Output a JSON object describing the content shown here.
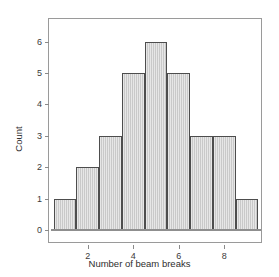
{
  "chart_data": {
    "type": "bar",
    "title": "",
    "subtitle": "",
    "xlabel": "Number of beam breaks",
    "ylabel": "Count",
    "categories": [
      1,
      2,
      3,
      4,
      5,
      6,
      7,
      8,
      9
    ],
    "values": [
      1,
      2,
      3,
      5,
      6,
      5,
      3,
      3,
      1
    ],
    "series": [
      {
        "name": "Count",
        "values": [
          1,
          2,
          3,
          5,
          6,
          5,
          3,
          3,
          1
        ]
      }
    ],
    "bin_width": 1,
    "bin_edges": [
      0.5,
      1.5,
      2.5,
      3.5,
      4.5,
      5.5,
      6.5,
      7.5,
      8.5,
      9.5
    ],
    "xlim": [
      0.3,
      9.7
    ],
    "ylim": [
      0,
      6.4
    ],
    "x_ticks": [
      2,
      4,
      6,
      8
    ],
    "x_tick_labels": [
      "2",
      "4",
      "6",
      "8"
    ],
    "y_ticks": [
      0,
      1,
      2,
      3,
      4,
      5,
      6
    ],
    "y_tick_labels": [
      "0",
      "1",
      "2",
      "3",
      "4",
      "5",
      "6"
    ],
    "grid": false,
    "legend": false,
    "legend_position": "none",
    "annotations": [],
    "colors": {
      "bar_fill": "#c9c9c9",
      "bar_border": "#4d4d4d",
      "frame": "#9a9a9a",
      "axis": "#8a8a8a",
      "text": "#2e2e2e",
      "background": "#ffffff"
    }
  }
}
